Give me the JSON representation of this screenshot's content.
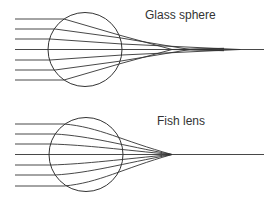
{
  "panels": [
    {
      "title": "Glass sphere",
      "label_pos": {
        "x": 145,
        "y": 9
      },
      "circle": {
        "cx": 85,
        "cy": 49.5,
        "r": 37
      },
      "axis": {
        "y": 49.5,
        "x_start": 15,
        "x_end": 264
      },
      "rays": [
        {
          "y": 19,
          "enter_x": 64,
          "exit_x": 119,
          "exit_y": 35,
          "focus_x": 172
        },
        {
          "y": 29,
          "enter_x": 55,
          "exit_x": 121,
          "exit_y": 38,
          "focus_x": 190
        },
        {
          "y": 39,
          "enter_x": 50,
          "exit_x": 122,
          "exit_y": 44,
          "focus_x": 240
        },
        {
          "y": 60,
          "enter_x": 50,
          "exit_x": 122,
          "exit_y": 55,
          "focus_x": 240
        },
        {
          "y": 70,
          "enter_x": 55,
          "exit_x": 121,
          "exit_y": 61,
          "focus_x": 190
        },
        {
          "y": 80,
          "enter_x": 64,
          "exit_x": 119,
          "exit_y": 64,
          "focus_x": 172
        }
      ]
    },
    {
      "title": "Fish lens",
      "label_pos": {
        "x": 157,
        "y": 115
      },
      "circle": {
        "cx": 86,
        "cy": 154.5,
        "r": 37
      },
      "axis": {
        "y": 154.5,
        "x_start": 15,
        "x_end": 264
      },
      "focus": {
        "x": 172,
        "y": 154.5
      },
      "rays": [
        {
          "y": 124,
          "enter_x": 64
        },
        {
          "y": 134,
          "enter_x": 55
        },
        {
          "y": 144,
          "enter_x": 51
        },
        {
          "y": 165,
          "enter_x": 51
        },
        {
          "y": 175,
          "enter_x": 55
        },
        {
          "y": 186,
          "enter_x": 64
        }
      ]
    }
  ],
  "colors": {
    "line": "#333333",
    "text": "#333333",
    "background": "#ffffff"
  }
}
